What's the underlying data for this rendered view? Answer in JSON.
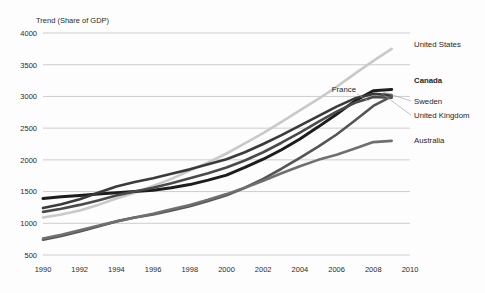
{
  "chart_data": {
    "type": "line",
    "title": "Trend (Share of GDP)",
    "xlabel": "",
    "ylabel": "",
    "xlim": [
      1990,
      2010
    ],
    "ylim": [
      500,
      4000
    ],
    "ytick_step": 500,
    "xtick_step": 2,
    "grid": true,
    "legend_position": "right-inline",
    "yticks": [
      "4000",
      "3500",
      "3000",
      "2500",
      "2000",
      "1500",
      "1000",
      "500"
    ],
    "xticks": [
      "1990",
      "1992",
      "1994",
      "1996",
      "1998",
      "2000",
      "2002",
      "2004",
      "2006",
      "2008",
      "2010"
    ],
    "x": [
      1990,
      1991,
      1992,
      1993,
      1994,
      1995,
      1996,
      1997,
      1998,
      1999,
      2000,
      2001,
      2002,
      2003,
      2004,
      2005,
      2006,
      2007,
      2008,
      2009
    ],
    "series": [
      {
        "name": "United States",
        "color": "#c9c9c9",
        "width": 2.6,
        "label_bold": false,
        "values": [
          1090,
          1140,
          1200,
          1290,
          1390,
          1480,
          1590,
          1700,
          1830,
          1960,
          2100,
          2260,
          2420,
          2600,
          2780,
          2960,
          3150,
          3360,
          3560,
          3750
        ]
      },
      {
        "name": "Canada",
        "color": "#1d1d1d",
        "width": 3.0,
        "label_bold": true,
        "values": [
          1390,
          1420,
          1440,
          1460,
          1480,
          1500,
          1520,
          1560,
          1610,
          1680,
          1760,
          1880,
          2010,
          2160,
          2330,
          2520,
          2720,
          2930,
          3090,
          3110
        ]
      },
      {
        "name": "Sweden",
        "color": "#3a3a3a",
        "width": 2.6,
        "label_bold": false,
        "values": [
          1240,
          1300,
          1380,
          1480,
          1580,
          1650,
          1710,
          1780,
          1850,
          1930,
          2010,
          2120,
          2250,
          2390,
          2540,
          2690,
          2840,
          2970,
          3040,
          3020
        ]
      },
      {
        "name": "United Kingdom",
        "color": "#4a4a4a",
        "width": 2.6,
        "label_bold": false,
        "values": [
          1180,
          1230,
          1290,
          1360,
          1440,
          1500,
          1560,
          1630,
          1710,
          1790,
          1880,
          1990,
          2120,
          2270,
          2430,
          2600,
          2760,
          2900,
          2990,
          2980
        ]
      },
      {
        "name": "France",
        "color": "#555555",
        "width": 2.6,
        "label_bold": false,
        "values": [
          740,
          800,
          870,
          950,
          1030,
          1090,
          1140,
          1200,
          1270,
          1350,
          1440,
          1560,
          1700,
          1860,
          2030,
          2210,
          2400,
          2620,
          2850,
          3000
        ]
      },
      {
        "name": "Australia",
        "color": "#6f6f6f",
        "width": 2.6,
        "label_bold": false,
        "values": [
          760,
          820,
          890,
          960,
          1030,
          1090,
          1150,
          1220,
          1290,
          1370,
          1460,
          1560,
          1670,
          1790,
          1900,
          2000,
          2080,
          2180,
          2280,
          2300
        ]
      }
    ],
    "annotations": [
      {
        "text": "France",
        "x": 356,
        "y": 92
      }
    ],
    "right_labels": [
      {
        "text": "United States",
        "x": 414,
        "y": 47,
        "bold": false
      },
      {
        "text": "Canada",
        "x": 414,
        "y": 83,
        "bold": true
      },
      {
        "text": "Sweden",
        "x": 414,
        "y": 104,
        "bold": false
      },
      {
        "text": "United Kingdom",
        "x": 414,
        "y": 118,
        "bold": false
      },
      {
        "text": "Australia",
        "x": 414,
        "y": 143,
        "bold": false
      }
    ]
  }
}
